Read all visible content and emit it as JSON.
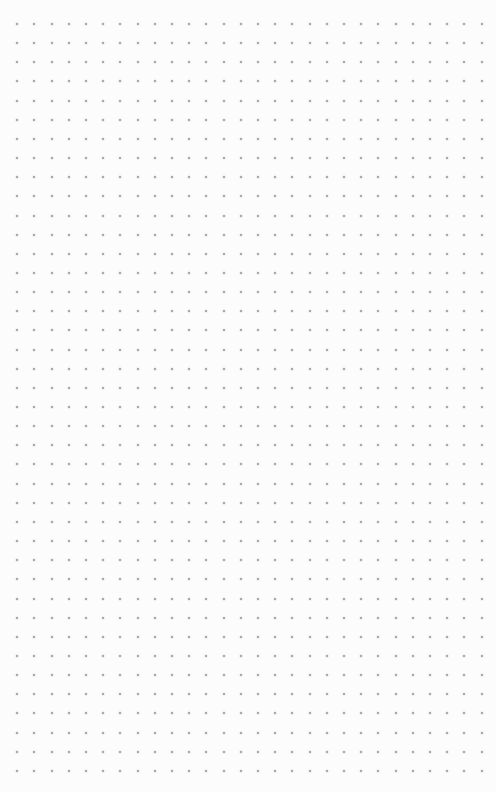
{
  "canvas": {
    "description": "Blank dot-grid page",
    "pattern": "dot-grid",
    "columns": 28,
    "rows": 40,
    "dot_color": "#9a9a9a",
    "background_color": "#fcfcfc"
  }
}
